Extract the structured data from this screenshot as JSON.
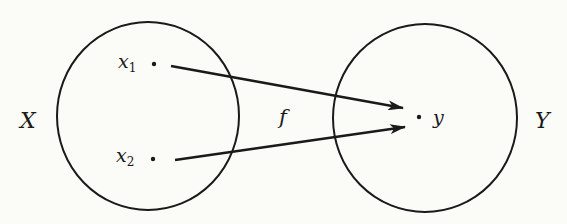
{
  "diagram": {
    "type": "function-mapping",
    "domain_set": {
      "label": "X",
      "elements": [
        {
          "name": "x",
          "subscript": "1"
        },
        {
          "name": "x",
          "subscript": "2"
        }
      ]
    },
    "codomain_set": {
      "label": "Y",
      "elements": [
        {
          "name": "y"
        }
      ]
    },
    "function_label": "f",
    "mappings": [
      {
        "from": "x1",
        "to": "y"
      },
      {
        "from": "x2",
        "to": "y"
      }
    ],
    "colors": {
      "ink": "#1a1a1a",
      "paper": "#fbfbf7"
    }
  }
}
